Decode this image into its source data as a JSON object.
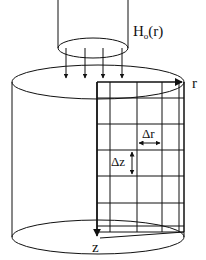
{
  "diagram": {
    "type": "cylinder-grid-schematic",
    "labels": {
      "source": "H",
      "source_sub": "o",
      "source_arg": "(r)",
      "r_axis": "r",
      "z_axis": "z",
      "delta_r": "Δr",
      "delta_z": "Δz"
    },
    "colors": {
      "stroke": "#111111",
      "background": "#ffffff"
    },
    "grid": {
      "columns_x": [
        97,
        110,
        137,
        162,
        179,
        184
      ],
      "rows_y": [
        82,
        98,
        124,
        150,
        176,
        203,
        228,
        238
      ]
    },
    "incident_arrows_x": [
      66,
      85,
      103,
      122
    ]
  }
}
